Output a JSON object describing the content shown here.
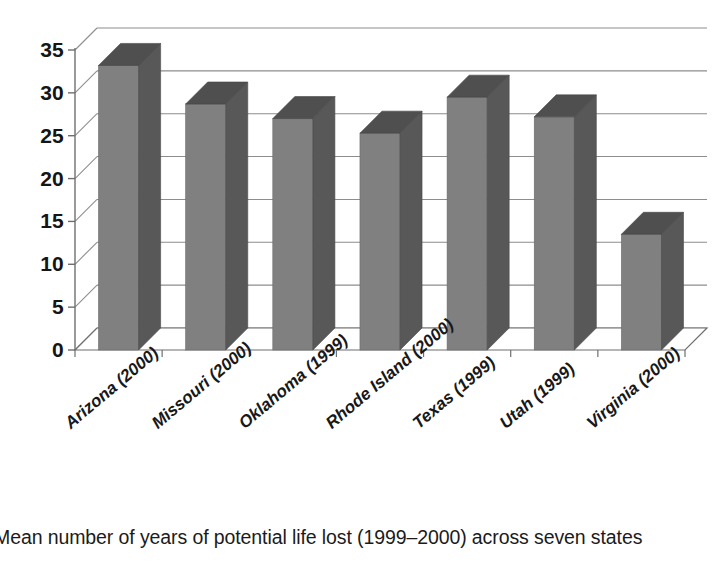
{
  "figure": {
    "caption": "Mean number of years of potential life lost (1999–2000) across seven states"
  },
  "colors": {
    "bar_front": "#808080",
    "bar_side": "#585858",
    "bar_top": "#4f4f4f",
    "gridline": "#8d8d8d",
    "axis": "#6f6f6f",
    "text": "#181818",
    "background": "#ffffff"
  },
  "chart_data": {
    "type": "bar",
    "title": "",
    "xlabel": "",
    "ylabel": "",
    "categories": [
      "Arizona (2000)",
      "Missouri (2000)",
      "Oklahoma (1999)",
      "Rhode Island (2000)",
      "Texas (1999)",
      "Utah (1999)",
      "Virginia (2000)"
    ],
    "values": [
      33.2,
      28.7,
      27.0,
      25.3,
      29.5,
      27.2,
      13.5
    ],
    "ylim": [
      0,
      35
    ],
    "yticks": [
      0,
      5,
      10,
      15,
      20,
      25,
      30,
      35
    ],
    "ytick_labels": [
      "0",
      "5",
      "10",
      "15",
      "20",
      "25",
      "30",
      "35"
    ],
    "grid": true,
    "legend": false,
    "three_d": true,
    "series": [
      {
        "name": "Mean years of potential life lost",
        "values": [
          33.2,
          28.7,
          27.0,
          25.3,
          29.5,
          27.2,
          13.5
        ]
      }
    ]
  }
}
